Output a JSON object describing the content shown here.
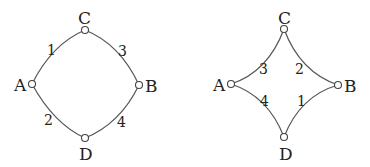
{
  "diagrams": [
    {
      "name": "convex",
      "nodes": {
        "A": "A",
        "B": "B",
        "C": "C",
        "D": "D"
      },
      "edges": [
        {
          "from": "A",
          "to": "C",
          "label": "1"
        },
        {
          "from": "A",
          "to": "D",
          "label": "2"
        },
        {
          "from": "C",
          "to": "B",
          "label": "3"
        },
        {
          "from": "D",
          "to": "B",
          "label": "4"
        }
      ]
    },
    {
      "name": "concave",
      "nodes": {
        "A": "A",
        "B": "B",
        "C": "C",
        "D": "D"
      },
      "edges": [
        {
          "from": "A",
          "to": "C",
          "label": "3"
        },
        {
          "from": "C",
          "to": "B",
          "label": "2"
        },
        {
          "from": "A",
          "to": "D",
          "label": "4"
        },
        {
          "from": "D",
          "to": "B",
          "label": "1"
        }
      ]
    }
  ]
}
